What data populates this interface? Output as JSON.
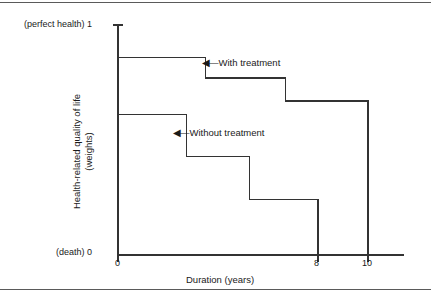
{
  "chart_data": {
    "type": "line",
    "title": "",
    "xlabel": "Duration (years)",
    "ylabel_line1": "Health-related quality of life",
    "ylabel_line2": "(weights)",
    "xlim": [
      0,
      11.5
    ],
    "ylim": [
      0,
      1
    ],
    "grid": false,
    "legend_position": "inline-annotations",
    "xticks": [
      {
        "value": 0,
        "label": "0"
      },
      {
        "value": 8,
        "label": "8"
      },
      {
        "value": 10,
        "label": "10"
      }
    ],
    "yticks": [
      {
        "value": 1,
        "label": "(perfect health) 1"
      },
      {
        "value": 0,
        "label": "(death) 0"
      }
    ],
    "series": [
      {
        "name": "With treatment",
        "style": "step-post",
        "points": [
          {
            "x": 0,
            "y": 0.86
          },
          {
            "x": 3.5,
            "y": 0.86
          },
          {
            "x": 3.5,
            "y": 0.77
          },
          {
            "x": 6.7,
            "y": 0.77
          },
          {
            "x": 6.7,
            "y": 0.67
          },
          {
            "x": 10,
            "y": 0.67
          },
          {
            "x": 10,
            "y": 0
          }
        ]
      },
      {
        "name": "Without treatment",
        "style": "step-post",
        "points": [
          {
            "x": 0,
            "y": 0.61
          },
          {
            "x": 2.75,
            "y": 0.61
          },
          {
            "x": 2.75,
            "y": 0.43
          },
          {
            "x": 5.25,
            "y": 0.43
          },
          {
            "x": 5.25,
            "y": 0.24
          },
          {
            "x": 8,
            "y": 0.24
          },
          {
            "x": 8,
            "y": 0
          }
        ]
      }
    ],
    "annotations": [
      {
        "text": "With treatment",
        "arrow": "◀—",
        "points_to": "With treatment"
      },
      {
        "text": "Without treatment",
        "arrow": "◀—",
        "points_to": "Without treatment"
      }
    ],
    "colors": {
      "line": "#333333",
      "axis": "#333333",
      "background": "#ffffff",
      "text": "#1a1a1a",
      "rule": "#5a5a5a"
    }
  },
  "axis_labels": {
    "y_top": "(perfect health) 1",
    "y_bottom": "(death) 0",
    "x_0": "0",
    "x_8": "8",
    "x_10": "10",
    "x_title": "Duration (years)",
    "y_title_line1": "Health-related quality of life",
    "y_title_line2": "(weights)"
  },
  "annotations": {
    "with_treatment_arrow": "◀—",
    "with_treatment": "With treatment",
    "without_treatment_arrow": "◀—",
    "without_treatment": "Without treatment"
  }
}
